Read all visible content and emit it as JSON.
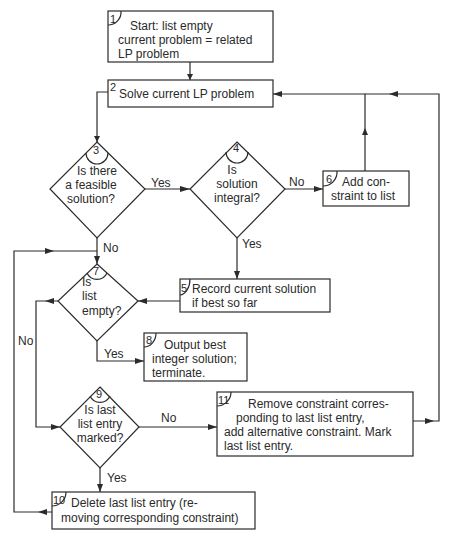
{
  "diagram": {
    "nodes": {
      "n1": {
        "id": "1",
        "type": "process",
        "lines": [
          "Start: list empty",
          "current problem = related",
          "LP problem"
        ]
      },
      "n2": {
        "id": "2",
        "type": "process",
        "lines": [
          "Solve current LP problem"
        ]
      },
      "n3": {
        "id": "3",
        "type": "decision",
        "lines": [
          "Is there",
          "a feasible",
          "solution?"
        ]
      },
      "n4": {
        "id": "4",
        "type": "decision",
        "lines": [
          "Is",
          "solution",
          "integral?"
        ]
      },
      "n5": {
        "id": "5",
        "type": "process",
        "lines": [
          "Record current solution",
          "if best so far"
        ]
      },
      "n6": {
        "id": "6",
        "type": "process",
        "lines": [
          "Add con-",
          "straint to list"
        ]
      },
      "n7": {
        "id": "7",
        "type": "decision",
        "lines": [
          "Is",
          "list",
          "empty?"
        ]
      },
      "n8": {
        "id": "8",
        "type": "terminal",
        "lines": [
          "Output best",
          "integer solution;",
          "terminate."
        ]
      },
      "n9": {
        "id": "9",
        "type": "decision",
        "lines": [
          "Is last",
          "list entry",
          "marked?"
        ]
      },
      "n10": {
        "id": "10",
        "type": "process",
        "lines": [
          "Delete last list entry (re-",
          "moving corresponding constraint)"
        ]
      },
      "n11": {
        "id": "11",
        "type": "process",
        "lines": [
          "Remove constraint corres-",
          "ponding to last list entry,",
          "add alternative constraint. Mark",
          "last list entry."
        ]
      }
    },
    "edges": [
      {
        "from": "1",
        "to": "2",
        "label": ""
      },
      {
        "from": "2",
        "to": "3",
        "label": ""
      },
      {
        "from": "3",
        "to": "4",
        "label": "Yes"
      },
      {
        "from": "3",
        "to": "7",
        "label": "No"
      },
      {
        "from": "4",
        "to": "6",
        "label": "No"
      },
      {
        "from": "4",
        "to": "5",
        "label": "Yes"
      },
      {
        "from": "6",
        "to": "2",
        "label": ""
      },
      {
        "from": "5",
        "to": "7",
        "label": ""
      },
      {
        "from": "7",
        "to": "8",
        "label": "Yes"
      },
      {
        "from": "7",
        "to": "9",
        "label": "No"
      },
      {
        "from": "9",
        "to": "11",
        "label": "No"
      },
      {
        "from": "9",
        "to": "10",
        "label": "Yes"
      },
      {
        "from": "10",
        "to": "7",
        "label": ""
      },
      {
        "from": "11",
        "to": "2",
        "label": ""
      }
    ],
    "labels": {
      "yes": "Yes",
      "no": "No"
    }
  }
}
